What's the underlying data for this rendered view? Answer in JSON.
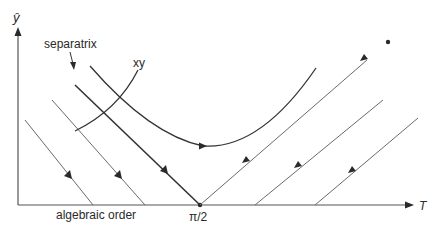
{
  "diagram": {
    "y_axis_label": "ŷ",
    "x_axis_label": "T",
    "separatrix_label": "separatrix",
    "curve_label": "xy",
    "x_origin_label": "algebraic order",
    "x_tick_label": "π/2",
    "colors": {
      "line": "#3a3a3a",
      "thin_line": "#6a6a6a",
      "background": "#ffffff"
    }
  }
}
